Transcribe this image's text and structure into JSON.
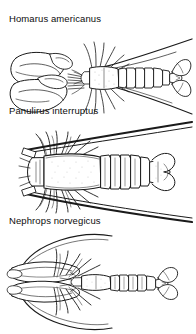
{
  "figure": {
    "title_visible": false,
    "background_color": "#ffffff",
    "ink_color": "#1a1a1a",
    "style": "black-and-white stippled line drawing, dorsal view",
    "specimens": [
      {
        "label": "Homarus americanus",
        "common_form": "clawed lobster with very large chelae",
        "view": "dorsal",
        "features": [
          "two large stippled claws",
          "segmented abdomen",
          "fan-shaped tail",
          "long thin antennae"
        ]
      },
      {
        "label": "Panulirus interruptus",
        "common_form": "spiny lobster without large claws",
        "view": "dorsal",
        "features": [
          "two very thick long antennae",
          "no enlarged claws",
          "banded abdomen",
          "broad tail fan"
        ]
      },
      {
        "label": "Nephrops norvegicus",
        "common_form": "Norway lobster with slender elongated claws",
        "view": "dorsal",
        "features": [
          "long narrow claws",
          "segmented abdomen",
          "fan-shaped tail",
          "thin antennae"
        ]
      }
    ]
  }
}
